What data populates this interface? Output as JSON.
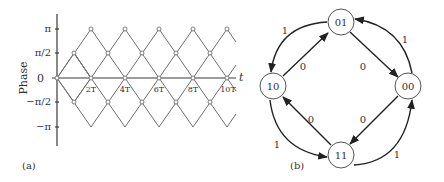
{
  "panel_a": {
    "label": "(a)",
    "ylabel": "Phase",
    "xaxis_label": "t",
    "yticks": [
      "π",
      "π/2",
      "0",
      "−π/2",
      "−π"
    ],
    "xticks": [
      "2T",
      "4T",
      "6T",
      "8T",
      "10T"
    ]
  },
  "panel_b": {
    "label": "(b)",
    "states": [
      "01",
      "00",
      "11",
      "10"
    ],
    "transitions": [
      {
        "from": "01",
        "to": "00",
        "label": "0"
      },
      {
        "from": "00",
        "to": "01",
        "label": "1"
      },
      {
        "from": "00",
        "to": "11",
        "label": "0"
      },
      {
        "from": "11",
        "to": "00",
        "label": "1"
      },
      {
        "from": "11",
        "to": "10",
        "label": "0"
      },
      {
        "from": "10",
        "to": "11",
        "label": "1"
      },
      {
        "from": "10",
        "to": "01",
        "label": "0"
      },
      {
        "from": "01",
        "to": "10",
        "label": "1"
      }
    ]
  }
}
